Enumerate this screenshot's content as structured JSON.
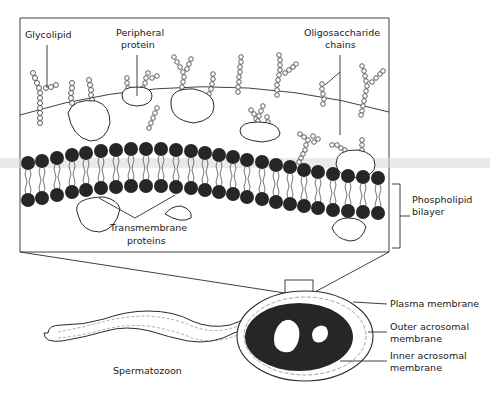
{
  "figure": {
    "type": "biological membrane diagram"
  },
  "labels": {
    "glycolipid": "Glycolipid",
    "peripheral_protein_line1": "Peripheral",
    "peripheral_protein_line2": "protein",
    "oligosaccharide_line1": "Oligosaccharide",
    "oligosaccharide_line2": "chains",
    "phospholipid_line1": "Phospholipid",
    "phospholipid_line2": "bilayer",
    "transmembrane_line1": "Transmembrane",
    "transmembrane_line2": "proteins",
    "plasma_membrane": "Plasma membrane",
    "outer_acrosomal_line1": "Outer acrosomal",
    "outer_acrosomal_line2": "membrane",
    "inner_acrosomal_line1": "Inner acrosomal",
    "inner_acrosomal_line2": "membrane",
    "spermatozoon": "Spermatozoon"
  },
  "colors": {
    "ink": "#1a1a1a",
    "head_fill": "#262626",
    "background": "#ffffff"
  }
}
